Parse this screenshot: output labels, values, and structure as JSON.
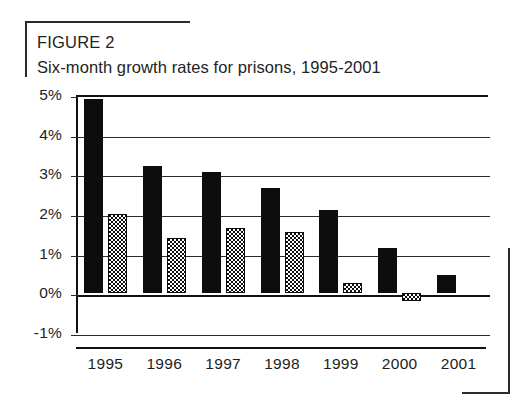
{
  "figure": {
    "label": "FIGURE 2",
    "title": "Six-month growth rates for prisons, 1995-2001"
  },
  "chart_data": {
    "type": "bar",
    "title": "Six-month growth rates for prisons, 1995-2001",
    "xlabel": "",
    "ylabel": "",
    "categories": [
      "1995",
      "1996",
      "1997",
      "1998",
      "1999",
      "2000",
      "2001"
    ],
    "series": [
      {
        "name": "first-half",
        "style": "solid-black",
        "values": [
          4.9,
          3.2,
          3.05,
          2.65,
          2.1,
          1.15,
          0.45
        ]
      },
      {
        "name": "second-half",
        "style": "dotted-hatch",
        "values": [
          2.0,
          1.4,
          1.65,
          1.55,
          0.25,
          -0.2,
          null
        ]
      }
    ],
    "ylim": [
      -1,
      5
    ],
    "ytick_labels": [
      "5%",
      "4%",
      "3%",
      "2%",
      "1%",
      "0%",
      "-1%"
    ],
    "ytick_values": [
      5,
      4,
      3,
      2,
      1,
      0,
      -1
    ],
    "grid": true,
    "legend": "none"
  }
}
